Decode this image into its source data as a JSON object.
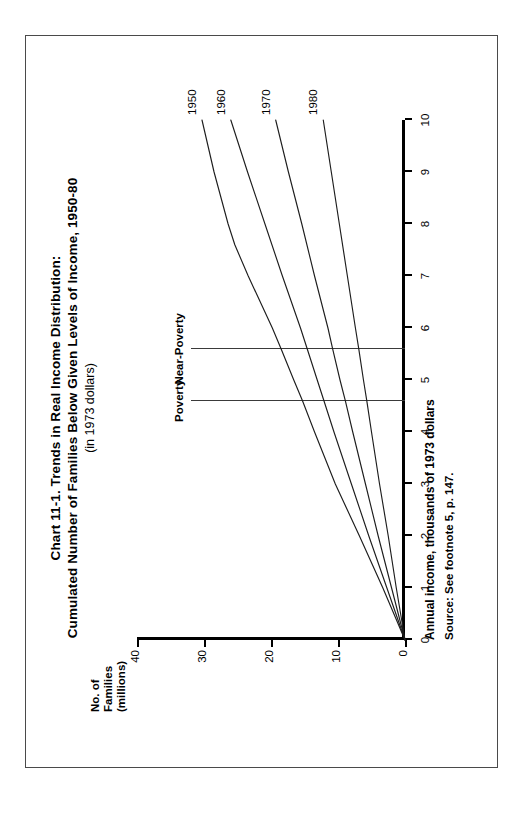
{
  "figure": {
    "title_line1": "Chart 11-1. Trends in Real Income Distribution:",
    "title_line2": "Cumulated Number of Families Below Given Levels of Income, 1950-80",
    "subtitle": "(in 1973 dollars)",
    "source_note": "Source: See footnote 5, p. 147."
  },
  "chart_data": {
    "type": "line",
    "title": "Chart 11-1. Trends in Real Income Distribution: Cumulated Number of Families Below Given Levels of Income, 1950-80",
    "subtitle": "(in 1973 dollars)",
    "xlabel": "Annual income, thousands of 1973 dollars",
    "ylabel": "No. of Families (millions)",
    "ylabel_line1": "No. of",
    "ylabel_line2": "Families",
    "ylabel_line3": "(millions)",
    "xlim": [
      0,
      10
    ],
    "ylim": [
      0,
      40
    ],
    "xticks": [
      0,
      1,
      2,
      3,
      4,
      5,
      6,
      7,
      8,
      9,
      10
    ],
    "xtick_labels": [
      "0",
      "1",
      "2",
      "3",
      "4",
      "5",
      "6",
      "7",
      "8",
      "9",
      "10"
    ],
    "yticks": [
      0,
      10,
      20,
      30,
      40
    ],
    "ytick_labels": [
      "0",
      "10",
      "20",
      "30",
      "40"
    ],
    "grid": false,
    "legend_position": "end-of-line",
    "line_color": "#1d1d1d",
    "series": [
      {
        "name": "1950",
        "label": "1950",
        "x": [
          0,
          1,
          2,
          3,
          4,
          4.6,
          5,
          5.6,
          6,
          7,
          7.6,
          8,
          9,
          10
        ],
        "values": [
          0,
          3.3,
          6.8,
          10.4,
          13.5,
          15.3,
          16.6,
          18.5,
          19.8,
          23.4,
          25.4,
          26.4,
          28.5,
          30.3
        ]
      },
      {
        "name": "1960",
        "label": "1960",
        "x": [
          0,
          1,
          2,
          3,
          4,
          4.6,
          5,
          5.6,
          6,
          7,
          8,
          9,
          10
        ],
        "values": [
          0,
          2.7,
          5.4,
          8.0,
          10.6,
          12.1,
          13.1,
          14.6,
          15.6,
          18.3,
          20.9,
          23.5,
          26.0
        ]
      },
      {
        "name": "1970",
        "label": "1970",
        "x": [
          0,
          1,
          2,
          3,
          4,
          4.6,
          5,
          5.6,
          6,
          7,
          8,
          9,
          10
        ],
        "values": [
          0,
          2.0,
          4.0,
          5.9,
          7.8,
          8.9,
          9.7,
          10.8,
          11.5,
          13.5,
          15.4,
          17.4,
          19.3
        ]
      },
      {
        "name": "1980",
        "label": "1980",
        "x": [
          0,
          1,
          2,
          3,
          4,
          4.6,
          5,
          5.6,
          6,
          7,
          8,
          9,
          10
        ],
        "values": [
          0,
          1.3,
          2.5,
          3.8,
          5.0,
          5.7,
          6.2,
          6.9,
          7.4,
          8.6,
          9.8,
          11.0,
          12.2
        ]
      }
    ],
    "reference_lines": [
      {
        "label": "Poverty",
        "x": 4.6,
        "orientation": "vertical"
      },
      {
        "label": "Near-Poverty",
        "x": 5.6,
        "orientation": "vertical"
      }
    ]
  }
}
